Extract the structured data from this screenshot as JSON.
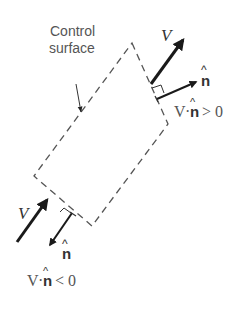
{
  "figure": {
    "label_control_surface_line1": "Control",
    "label_control_surface_line2": "surface",
    "outflow": {
      "velocity_label": "V",
      "normal_label": "n",
      "hat": "^",
      "relation_v": "V",
      "relation_dot": "·",
      "relation_n": "n",
      "relation_rest": "> 0"
    },
    "inflow": {
      "velocity_label": "V",
      "normal_label": "n",
      "hat": "^",
      "relation_v": "V",
      "relation_dot": "·",
      "relation_n": "n",
      "relation_rest": "< 0"
    },
    "colors": {
      "dash": "#555555",
      "arrow": "#1a1a1a",
      "text": "#555555"
    }
  }
}
